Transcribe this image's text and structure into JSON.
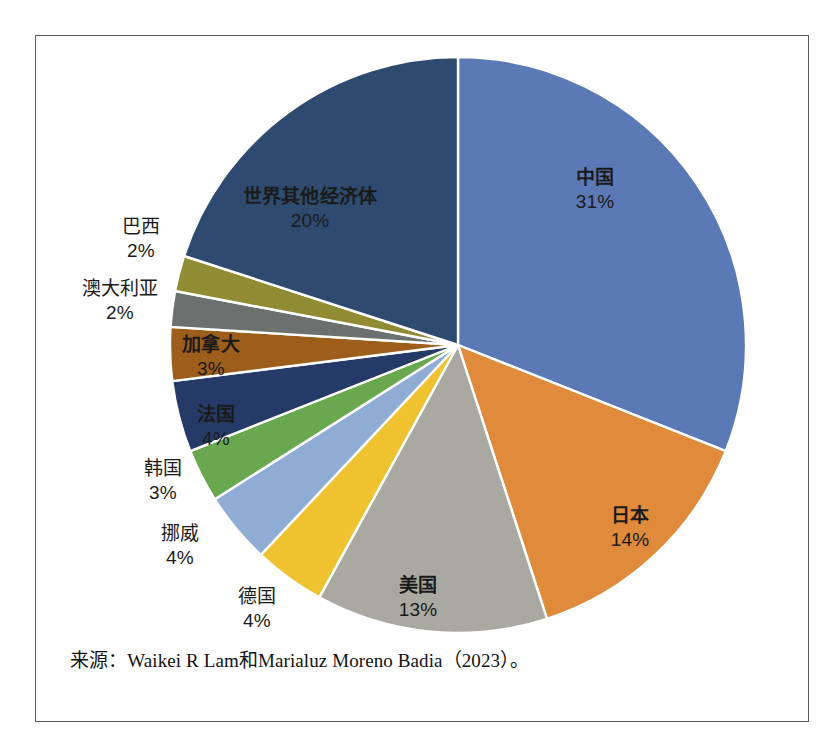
{
  "figure": {
    "background_color": "#ffffff",
    "frame_color": "#5a5a5a",
    "source_note": "来源：Waikei R Lam和Marialuz Moreno Badia（2023）。"
  },
  "chart_data": {
    "type": "pie",
    "title": "",
    "subtitle": "",
    "xlabel": "",
    "ylabel": "",
    "legend_position": "none",
    "grid": false,
    "label_format": "{name}\n{value}%",
    "start_angle_deg": 0,
    "direction": "clockwise",
    "total": 100,
    "units": "%",
    "categories": [
      "中国",
      "日本",
      "美国",
      "德国",
      "挪威",
      "韩国",
      "法国",
      "加拿大",
      "澳大利亚",
      "巴西",
      "世界其他经济体"
    ],
    "values": [
      31,
      14,
      13,
      4,
      4,
      3,
      4,
      3,
      2,
      2,
      20
    ],
    "colors": [
      "#5b79b5",
      "#e08a3c",
      "#a9a9a1",
      "#efc230",
      "#8fadd4",
      "#6aa84f",
      "#253a66",
      "#9d5e1c",
      "#6c7170",
      "#8f8c33",
      "#2e4a6e"
    ],
    "slices": [
      {
        "name": "中国",
        "value": 31,
        "label": "31%",
        "color": "#5b79b5",
        "label_placement": "inside"
      },
      {
        "name": "日本",
        "value": 14,
        "label": "14%",
        "color": "#e08a3c",
        "label_placement": "inside"
      },
      {
        "name": "美国",
        "value": 13,
        "label": "13%",
        "color": "#a9a9a1",
        "label_placement": "inside"
      },
      {
        "name": "德国",
        "value": 4,
        "label": "4%",
        "color": "#efc230",
        "label_placement": "outside"
      },
      {
        "name": "挪威",
        "value": 4,
        "label": "4%",
        "color": "#8fadd4",
        "label_placement": "outside"
      },
      {
        "name": "韩国",
        "value": 3,
        "label": "3%",
        "color": "#6aa84f",
        "label_placement": "outside"
      },
      {
        "name": "法国",
        "value": 4,
        "label": "4%",
        "color": "#253a66",
        "label_placement": "inside"
      },
      {
        "name": "加拿大",
        "value": 3,
        "label": "3%",
        "color": "#9d5e1c",
        "label_placement": "inside"
      },
      {
        "name": "澳大利亚",
        "value": 2,
        "label": "2%",
        "color": "#6c7170",
        "label_placement": "outside"
      },
      {
        "name": "巴西",
        "value": 2,
        "label": "2%",
        "color": "#8f8c33",
        "label_placement": "outside"
      },
      {
        "name": "世界其他经济体",
        "value": 20,
        "label": "20%",
        "color": "#2e4a6e",
        "label_placement": "inside"
      }
    ]
  },
  "labels": {
    "china": {
      "name": "中国",
      "pct": "31%"
    },
    "japan": {
      "name": "日本",
      "pct": "14%"
    },
    "usa": {
      "name": "美国",
      "pct": "13%"
    },
    "germany": {
      "name": "德国",
      "pct": "4%"
    },
    "norway": {
      "name": "挪威",
      "pct": "4%"
    },
    "korea": {
      "name": "韩国",
      "pct": "3%"
    },
    "france": {
      "name": "法国",
      "pct": "4%"
    },
    "canada": {
      "name": "加拿大",
      "pct": "3%"
    },
    "australia": {
      "name": "澳大利亚",
      "pct": "2%"
    },
    "brazil": {
      "name": "巴西",
      "pct": "2%"
    },
    "rest": {
      "name": "世界其他经济体",
      "pct": "20%"
    }
  }
}
